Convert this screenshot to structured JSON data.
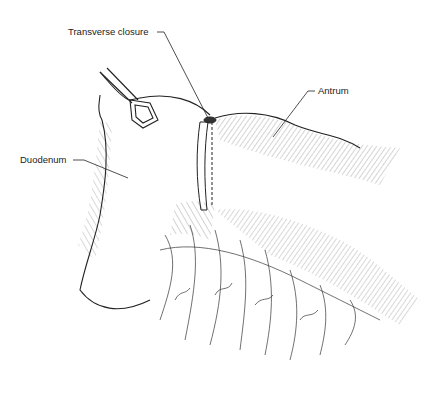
{
  "figure": {
    "type": "surgical-illustration",
    "labels": {
      "transverse_closure": "Transverse closure",
      "antrum": "Antrum",
      "duodenum": "Duodenum"
    },
    "colors": {
      "ink": "#222222",
      "background": "#ffffff"
    }
  }
}
